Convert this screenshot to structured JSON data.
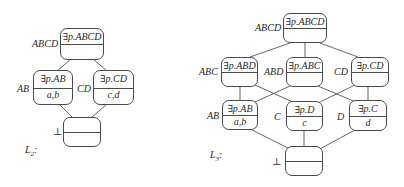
{
  "lattices": [
    {
      "name": "L_2",
      "caption": "L",
      "caption_sub": "2",
      "caption_suffix": ":",
      "nodes": [
        {
          "id": "ABCD",
          "label": "ABCD",
          "top": "∃p.ABCD",
          "bottom": ""
        },
        {
          "id": "AB",
          "label": "AB",
          "top": "∃p.AB",
          "bottom": "a,b"
        },
        {
          "id": "CD",
          "label": "CD",
          "top": "∃p.CD",
          "bottom": "c,d"
        },
        {
          "id": "bot",
          "label": "⊥",
          "top": "",
          "bottom": ""
        }
      ],
      "edges": [
        [
          "ABCD",
          "AB"
        ],
        [
          "ABCD",
          "CD"
        ],
        [
          "AB",
          "bot"
        ],
        [
          "CD",
          "bot"
        ]
      ]
    },
    {
      "name": "L_3",
      "caption": "L",
      "caption_sub": "3",
      "caption_suffix": ":",
      "nodes": [
        {
          "id": "ABCD",
          "label": "ABCD",
          "top": "∃p.ABCD",
          "bottom": ""
        },
        {
          "id": "ABC",
          "label": "ABC",
          "top": "∃p.ABD",
          "bottom": ""
        },
        {
          "id": "ABD",
          "label": "ABD",
          "top": "∃p.ABC",
          "bottom": ""
        },
        {
          "id": "CD",
          "label": "CD",
          "top": "∃p.CD",
          "bottom": ""
        },
        {
          "id": "AB",
          "label": "AB",
          "top": "∃p.AB",
          "bottom": "a,b"
        },
        {
          "id": "C",
          "label": "C",
          "top": "∃p.D",
          "bottom": "c"
        },
        {
          "id": "D",
          "label": "D",
          "top": "∃p.C",
          "bottom": "d"
        },
        {
          "id": "bot",
          "label": "⊥",
          "top": "",
          "bottom": ""
        }
      ],
      "edges": [
        [
          "ABCD",
          "ABC"
        ],
        [
          "ABCD",
          "ABD"
        ],
        [
          "ABCD",
          "CD"
        ],
        [
          "ABC",
          "AB"
        ],
        [
          "ABC",
          "C"
        ],
        [
          "ABD",
          "AB"
        ],
        [
          "ABD",
          "D"
        ],
        [
          "CD",
          "C"
        ],
        [
          "CD",
          "D"
        ],
        [
          "AB",
          "bot"
        ],
        [
          "C",
          "bot"
        ],
        [
          "D",
          "bot"
        ]
      ]
    }
  ]
}
